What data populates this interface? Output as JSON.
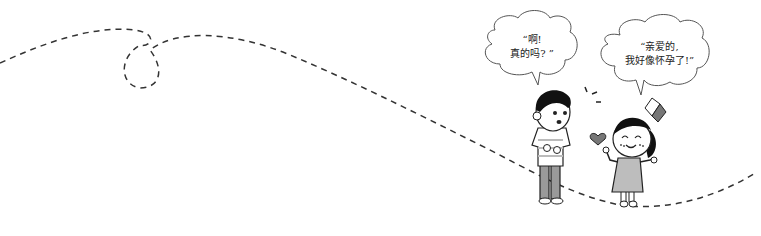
{
  "illustration": {
    "description": "Cartoon of a boy and a girl standing on a dashed path; the girl announces a pregnancy",
    "path": {
      "style": "dashed",
      "color": "#333333"
    },
    "characters": [
      {
        "id": "boy",
        "shirt": "striped white/grey",
        "pants": "grey",
        "hair": "black"
      },
      {
        "id": "girl",
        "dress": "light grey",
        "hair": "black with bow",
        "expression": "smiling, blushing"
      }
    ],
    "decorations": [
      "heart",
      "surprise-marks"
    ]
  },
  "speech_bubbles": {
    "boy": {
      "line1": "“啊!",
      "line2": "真的吗? ”"
    },
    "girl": {
      "line1": "“亲爱的,",
      "line2": "我好像怀孕了!”"
    }
  },
  "colors": {
    "line": "#222222",
    "fill_grey": "#9a9a9a",
    "fill_light": "#d9d9d9",
    "hair": "#111111",
    "skin": "#ffffff"
  }
}
